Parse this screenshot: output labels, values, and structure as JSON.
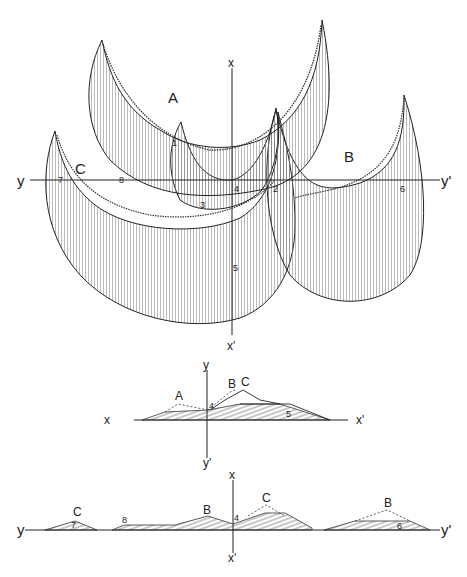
{
  "plan_view": {
    "axes": {
      "x_top": "x",
      "x_bottom": "x'",
      "y_left": "y",
      "y_right": "y'"
    },
    "dunes": [
      {
        "id": "A",
        "label": "A"
      },
      {
        "id": "B",
        "label": "B"
      },
      {
        "id": "C",
        "label": "C"
      }
    ],
    "points": [
      "1",
      "2",
      "3",
      "4",
      "5",
      "6",
      "7",
      "8"
    ]
  },
  "profile_x": {
    "axes": {
      "left": "x",
      "right": "x'",
      "top": "y",
      "bottom": "y'"
    },
    "labels": {
      "A": "A",
      "B": "B",
      "C": "C",
      "p4": "4",
      "p5": "5"
    }
  },
  "profile_y": {
    "axes": {
      "left": "y",
      "right": "y'",
      "top": "x",
      "bottom": "x'"
    },
    "labels": {
      "C1": "C",
      "B1": "B",
      "C2": "C",
      "B2": "B",
      "p4": "4",
      "p7": "7",
      "p8": "8",
      "p6": "6"
    }
  },
  "colors": {
    "ink": "#222222",
    "hatch": "#555555",
    "background": "#ffffff"
  }
}
